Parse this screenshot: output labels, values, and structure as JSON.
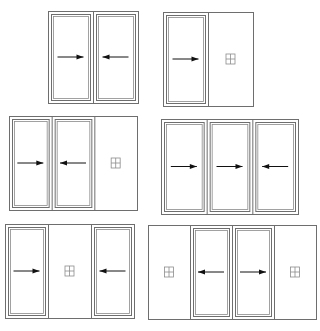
{
  "colors": {
    "frame": "#6e6e6e",
    "frame_inner": "#8a8a8a",
    "arrow": "#111111",
    "fixed_symbol": "#8c8c8c",
    "background": "#ffffff"
  },
  "legend": {
    "sliding_right": "arrow-right (sliding panel, moves right)",
    "sliding_left": "arrow-left (sliding panel, moves left)",
    "fixed": "fixed panel symbol"
  },
  "diagrams": [
    {
      "id": "config-1",
      "panels": [
        "slide-right",
        "slide-left"
      ]
    },
    {
      "id": "config-2",
      "panels": [
        "slide-right",
        "fixed"
      ]
    },
    {
      "id": "config-3",
      "panels": [
        "slide-right",
        "slide-left",
        "fixed"
      ]
    },
    {
      "id": "config-4",
      "panels": [
        "slide-right",
        "slide-right",
        "slide-left"
      ]
    },
    {
      "id": "config-5",
      "panels": [
        "slide-right",
        "fixed",
        "slide-left"
      ]
    },
    {
      "id": "config-6",
      "panels": [
        "fixed",
        "slide-left",
        "slide-right",
        "fixed"
      ]
    }
  ]
}
